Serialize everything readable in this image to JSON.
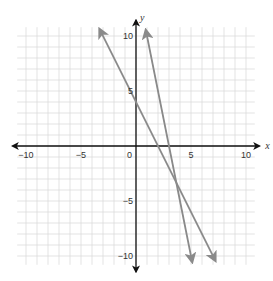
{
  "chart_data": {
    "type": "line",
    "title": "",
    "xlabel": "x",
    "ylabel": "y",
    "xlim": [
      -11,
      11
    ],
    "ylim": [
      -11,
      11
    ],
    "grid": true,
    "x_ticks": [
      -10,
      -5,
      0,
      5,
      10
    ],
    "y_ticks": [
      10,
      5,
      -5,
      -10
    ],
    "x_tick_labels": [
      "−10",
      "−5",
      "0",
      "5",
      "10"
    ],
    "y_tick_labels": [
      "10",
      "5",
      "−5",
      "−10"
    ],
    "series": [
      {
        "name": "line-1",
        "equation": "y = -2x + 4",
        "slope": -2,
        "intercept": 4,
        "x": [
          -3.3,
          7.2
        ],
        "color": "#8a8a8a"
      },
      {
        "name": "line-2",
        "equation": "y = -5x + 15",
        "slope": -5,
        "intercept": 15,
        "x": [
          0.9,
          5.1
        ],
        "color": "#8a8a8a"
      }
    ]
  }
}
